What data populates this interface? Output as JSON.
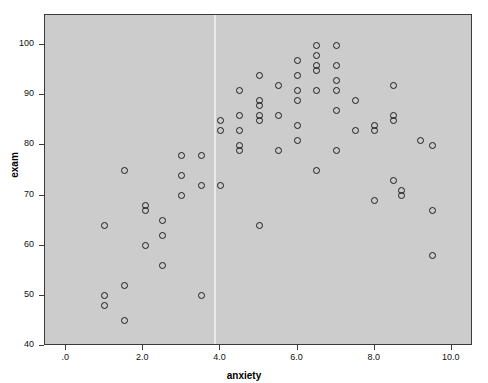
{
  "chart_data": {
    "type": "scatter",
    "title": "",
    "xlabel": "anxiety",
    "ylabel": "exam",
    "xlim": [
      -0.55,
      10.55
    ],
    "ylim": [
      40,
      106
    ],
    "grid": false,
    "legend": "none",
    "xticks": [
      0,
      2,
      4,
      6,
      8,
      10
    ],
    "xtick_labels": [
      ".0",
      "2.0",
      "4.0",
      "6.0",
      "8.0",
      "10.0"
    ],
    "yticks": [
      40,
      50,
      60,
      70,
      80,
      90,
      100
    ],
    "ytick_labels": [
      "40",
      "50",
      "60",
      "70",
      "80",
      "90",
      "100"
    ],
    "marker": "open-circle",
    "marker_color": "#1b1b1b",
    "plot_background": "#cccccc",
    "page_background": "#ffffff",
    "reference_line_x": 3.85,
    "reference_line_color": "#e9e9e9",
    "points": [
      {
        "x": 1.0,
        "y": 64
      },
      {
        "x": 1.0,
        "y": 50
      },
      {
        "x": 1.0,
        "y": 48
      },
      {
        "x": 1.5,
        "y": 75
      },
      {
        "x": 1.5,
        "y": 52
      },
      {
        "x": 1.5,
        "y": 45
      },
      {
        "x": 2.05,
        "y": 68
      },
      {
        "x": 2.05,
        "y": 67
      },
      {
        "x": 2.05,
        "y": 60
      },
      {
        "x": 2.5,
        "y": 65
      },
      {
        "x": 2.5,
        "y": 62
      },
      {
        "x": 2.5,
        "y": 56
      },
      {
        "x": 3.0,
        "y": 78
      },
      {
        "x": 3.0,
        "y": 74
      },
      {
        "x": 3.0,
        "y": 70
      },
      {
        "x": 3.5,
        "y": 78
      },
      {
        "x": 3.5,
        "y": 72
      },
      {
        "x": 3.5,
        "y": 50
      },
      {
        "x": 4.0,
        "y": 85
      },
      {
        "x": 4.0,
        "y": 83
      },
      {
        "x": 4.0,
        "y": 72
      },
      {
        "x": 4.5,
        "y": 91
      },
      {
        "x": 4.5,
        "y": 86
      },
      {
        "x": 4.5,
        "y": 83
      },
      {
        "x": 4.5,
        "y": 80
      },
      {
        "x": 4.5,
        "y": 79
      },
      {
        "x": 5.0,
        "y": 94
      },
      {
        "x": 5.0,
        "y": 89
      },
      {
        "x": 5.0,
        "y": 88
      },
      {
        "x": 5.0,
        "y": 86
      },
      {
        "x": 5.0,
        "y": 85
      },
      {
        "x": 5.0,
        "y": 64
      },
      {
        "x": 5.5,
        "y": 92
      },
      {
        "x": 5.5,
        "y": 86
      },
      {
        "x": 5.5,
        "y": 79
      },
      {
        "x": 6.0,
        "y": 97
      },
      {
        "x": 6.0,
        "y": 94
      },
      {
        "x": 6.0,
        "y": 91
      },
      {
        "x": 6.0,
        "y": 89
      },
      {
        "x": 6.0,
        "y": 84
      },
      {
        "x": 6.0,
        "y": 81
      },
      {
        "x": 6.5,
        "y": 100
      },
      {
        "x": 6.5,
        "y": 98
      },
      {
        "x": 6.5,
        "y": 96
      },
      {
        "x": 6.5,
        "y": 95
      },
      {
        "x": 6.5,
        "y": 91
      },
      {
        "x": 6.5,
        "y": 75
      },
      {
        "x": 7.0,
        "y": 100
      },
      {
        "x": 7.0,
        "y": 96
      },
      {
        "x": 7.0,
        "y": 93
      },
      {
        "x": 7.0,
        "y": 91
      },
      {
        "x": 7.0,
        "y": 87
      },
      {
        "x": 7.0,
        "y": 79
      },
      {
        "x": 7.5,
        "y": 89
      },
      {
        "x": 7.5,
        "y": 83
      },
      {
        "x": 8.0,
        "y": 84
      },
      {
        "x": 8.0,
        "y": 83
      },
      {
        "x": 8.0,
        "y": 69
      },
      {
        "x": 8.5,
        "y": 92
      },
      {
        "x": 8.5,
        "y": 86
      },
      {
        "x": 8.5,
        "y": 85
      },
      {
        "x": 8.5,
        "y": 73
      },
      {
        "x": 8.7,
        "y": 71
      },
      {
        "x": 8.7,
        "y": 70
      },
      {
        "x": 9.2,
        "y": 81
      },
      {
        "x": 9.5,
        "y": 80
      },
      {
        "x": 9.5,
        "y": 67
      },
      {
        "x": 9.5,
        "y": 58
      }
    ]
  }
}
